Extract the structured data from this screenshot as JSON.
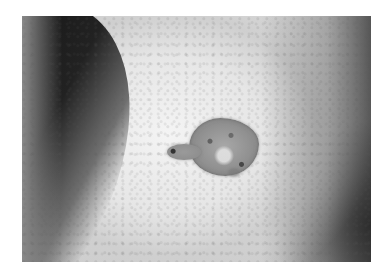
{
  "image": {
    "description": "Grayscale close-up photograph of a raised, irregular, scaly skin lesion on a curved body surface with a dark background at the upper left",
    "colors": {
      "border": "#ffffff",
      "skin_light": "#f0f0f0",
      "background_dark": "#1a1a1a",
      "lesion": "#959595"
    }
  }
}
